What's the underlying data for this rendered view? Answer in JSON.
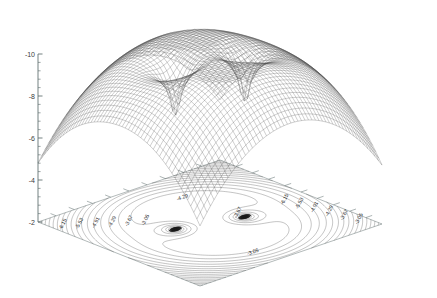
{
  "figure": {
    "type": "surface-mesh-contour-3d",
    "title": "",
    "background_color": "#ffffff",
    "mesh_color": "#4a4a4a",
    "contour_color": "#3c3c3c",
    "axis_color": "#5a6a6a",
    "width": 437,
    "height": 298
  },
  "axes": {
    "z": {
      "label": "",
      "ticks": [
        "-2",
        "-4",
        "-6",
        "-8",
        "-10"
      ],
      "range": [
        -10,
        -2
      ],
      "minor_ticks": 4
    },
    "x": {
      "label": "",
      "ticks": []
    },
    "y": {
      "label": "",
      "ticks": []
    }
  },
  "contours": {
    "labels": [
      "-3.05",
      "-3.67",
      "-4.29",
      "-4.91",
      "-5.53",
      "-6.15",
      "-5.53",
      "-4.91",
      "-4.29",
      "-3.67",
      "-3.05"
    ],
    "labeled_levels": [
      "-3.05",
      "-3.67",
      "-4.29",
      "-4.91",
      "-5.53",
      "-6.15"
    ],
    "left_edge_labels": [
      "-6.15",
      "-5.53",
      "-4.91",
      "-4.29",
      "-3.67",
      "-3.05"
    ],
    "right_edge_labels": [
      "-3.05",
      "-3.67",
      "-4.29",
      "-4.91",
      "-5.53",
      "-6.15"
    ],
    "bottom_labels": [
      "-4.29",
      "-3.67",
      "-3.05"
    ]
  },
  "chart_data": {
    "type": "surface",
    "title": "",
    "xlabel": "",
    "ylabel": "",
    "zlabel": "",
    "zlim": [
      -10,
      -2
    ],
    "z_ticks": [
      -2,
      -4,
      -6,
      -8,
      -10
    ],
    "features": [
      {
        "name": "dome-peak",
        "z": -2.1
      },
      {
        "name": "funnel-singularity-left",
        "z": -10
      },
      {
        "name": "funnel-singularity-right",
        "z": -10
      }
    ],
    "contour_levels": [
      -6.15,
      -5.53,
      -4.91,
      -4.29,
      -3.67,
      -3.05
    ],
    "grid": false,
    "legend": "none",
    "mesh_rows": 40,
    "mesh_cols": 40
  }
}
